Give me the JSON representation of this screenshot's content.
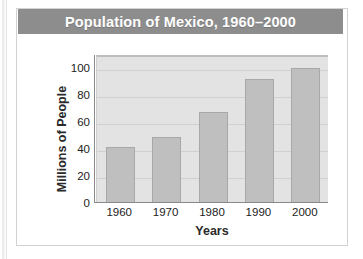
{
  "figure": {
    "title": "Population of Mexico, 1960–2000",
    "title_band_color": "#8d8d8d",
    "title_text_color": "#ffffff",
    "card_background": "#ffffff",
    "plot_background": "#e3e3e3",
    "bar_color": "#bfbfbf",
    "bar_border_color": "#a8a8a8",
    "gridline_color": "#d0d0d0",
    "axis_color": "#8a8a8a"
  },
  "chart_data": {
    "type": "bar",
    "title": "Population of Mexico, 1960–2000",
    "xlabel": "Years",
    "ylabel": "Millions of People",
    "categories": [
      "1960",
      "1970",
      "1980",
      "1990",
      "2000"
    ],
    "values": [
      42,
      49,
      68,
      92,
      100
    ],
    "ylim": [
      0,
      110
    ],
    "yticks": [
      0,
      20,
      40,
      60,
      80,
      100
    ],
    "ytick_labels": [
      "0",
      "20",
      "40",
      "60",
      "80",
      "100"
    ],
    "grid": true,
    "grid_axis": "y",
    "legend": false,
    "units": "millions of people"
  }
}
